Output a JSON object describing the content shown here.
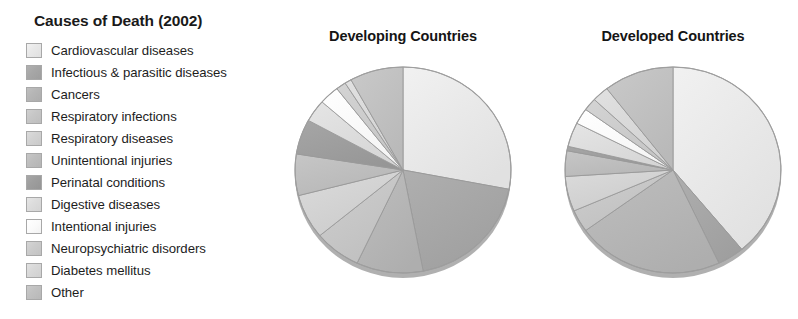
{
  "legend": {
    "title": "Causes of Death (2002)",
    "items": [
      {
        "label": "Cardiovascular diseases",
        "color": "#e8e8e8"
      },
      {
        "label": "Infectious & parasitic diseases",
        "color": "#a6a6a6"
      },
      {
        "label": "Cancers",
        "color": "#b5b5b5"
      },
      {
        "label": "Respiratory infections",
        "color": "#c6c6c6"
      },
      {
        "label": "Respiratory diseases",
        "color": "#d2d2d2"
      },
      {
        "label": "Unintentional injuries",
        "color": "#bdbdbd"
      },
      {
        "label": "Perinatal conditions",
        "color": "#9d9d9d"
      },
      {
        "label": "Digestive diseases",
        "color": "#dcdcdc"
      },
      {
        "label": "Intentional injuries",
        "color": "#fbfbfb"
      },
      {
        "label": "Neuropsychiatric disorders",
        "color": "#cbcbcb"
      },
      {
        "label": "Diabetes mellitus",
        "color": "#d8d8d8"
      },
      {
        "label": "Other",
        "color": "#c0c0c0"
      }
    ]
  },
  "charts": [
    {
      "title": "Developing Countries"
    },
    {
      "title": "Developed Countries"
    }
  ],
  "chart_data": [
    {
      "type": "pie",
      "title": "Developing Countries",
      "legend_position": "left",
      "start_angle": 0,
      "direction": "clockwise",
      "categories": [
        "Cardiovascular diseases",
        "Infectious & parasitic diseases",
        "Cancers",
        "Respiratory infections",
        "Respiratory diseases",
        "Unintentional injuries",
        "Perinatal conditions",
        "Digestive diseases",
        "Intentional injuries",
        "Neuropsychiatric disorders",
        "Diabetes mellitus",
        "Other"
      ],
      "values": [
        28,
        19,
        10,
        7,
        7,
        6.5,
        5.5,
        3.5,
        3,
        1.5,
        1,
        8
      ],
      "unit": "percent"
    },
    {
      "type": "pie",
      "title": "Developed Countries",
      "legend_position": "left",
      "start_angle": 0,
      "direction": "clockwise",
      "categories": [
        "Cardiovascular diseases",
        "Infectious & parasitic diseases",
        "Cancers",
        "Respiratory infections",
        "Respiratory diseases",
        "Unintentional injuries",
        "Perinatal conditions",
        "Digestive diseases",
        "Intentional injuries",
        "Neuropsychiatric disorders",
        "Diabetes mellitus",
        "Other"
      ],
      "values": [
        39,
        4,
        22,
        3.5,
        5.5,
        4,
        0.7,
        3.8,
        2.5,
        2,
        2.5,
        10.5
      ],
      "unit": "percent"
    }
  ]
}
